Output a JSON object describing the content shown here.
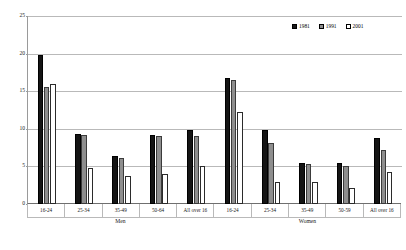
{
  "chart_data": {
    "type": "bar",
    "title": "",
    "xlabel": "",
    "ylabel": "",
    "ylim": [
      0,
      25
    ],
    "ytick_values": [
      0,
      5,
      10,
      15,
      20,
      25
    ],
    "ytick_labels": [
      "0",
      "5",
      "10",
      "15",
      "20",
      "25"
    ],
    "grid": true,
    "legend_position": "top-right",
    "categories": [
      "16-24",
      "25-34",
      "35-49",
      "50-64",
      "All over 16",
      "16-24",
      "25-34",
      "35-49",
      "50-59",
      "All over 16"
    ],
    "groups": [
      {
        "label": "Men",
        "categories": [
          "16-24",
          "25-34",
          "35-49",
          "50-64",
          "All over 16"
        ]
      },
      {
        "label": "Women",
        "categories": [
          "16-24",
          "25-34",
          "35-49",
          "50-59",
          "All over 16"
        ]
      }
    ],
    "series": [
      {
        "name": "1981",
        "color": "#141414",
        "values": [
          19.8,
          9.3,
          6.4,
          9.2,
          9.9,
          16.8,
          9.9,
          5.4,
          5.4,
          8.8
        ]
      },
      {
        "name": "1991",
        "color": "#8e8e8e",
        "values": [
          15.6,
          9.2,
          6.1,
          9.1,
          9.0,
          16.5,
          8.1,
          5.3,
          5.0,
          7.2
        ]
      },
      {
        "name": "2001",
        "color": "#ffffff",
        "values": [
          15.9,
          4.8,
          3.7,
          4.0,
          5.0,
          12.2,
          2.9,
          2.9,
          2.1,
          4.2
        ]
      }
    ]
  },
  "legend": {
    "items": [
      {
        "label": "1981",
        "swatch": "black-swatch"
      },
      {
        "label": "1991",
        "swatch": "grey-swatch"
      },
      {
        "label": "2001",
        "swatch": "white-swatch"
      }
    ]
  },
  "colors": {
    "series_1981": "#141414",
    "series_1991": "#8e8e8e",
    "series_2001": "#ffffff",
    "gridline": "#b9b9b9",
    "axis": "#6f6f6f",
    "background": "#ffffff"
  }
}
